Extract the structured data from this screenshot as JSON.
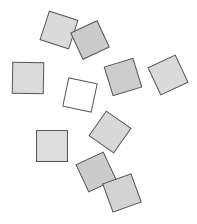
{
  "diagram": {
    "background": "#ffffff",
    "stroke": "#555555",
    "shapes": [
      {
        "id": "square-1",
        "cx": 59,
        "cy": 30,
        "size": 30,
        "rotation": 18,
        "fill": "#dadada"
      },
      {
        "id": "square-2",
        "cx": 90,
        "cy": 40,
        "size": 29,
        "rotation": -25,
        "fill": "#cbcbcb"
      },
      {
        "id": "square-3",
        "cx": 28,
        "cy": 78,
        "size": 31,
        "rotation": 1,
        "fill": "#dbdbdb"
      },
      {
        "id": "square-4",
        "cx": 80,
        "cy": 95,
        "size": 29,
        "rotation": 12,
        "fill": "#ffffff"
      },
      {
        "id": "square-5",
        "cx": 123,
        "cy": 77,
        "size": 30,
        "rotation": -17,
        "fill": "#cdcdcd"
      },
      {
        "id": "square-6",
        "cx": 168,
        "cy": 75,
        "size": 30,
        "rotation": -25,
        "fill": "#dadada"
      },
      {
        "id": "square-7",
        "cx": 52,
        "cy": 146,
        "size": 31,
        "rotation": 0,
        "fill": "#dcdcdc"
      },
      {
        "id": "square-8",
        "cx": 110,
        "cy": 132,
        "size": 30,
        "rotation": 35,
        "fill": "#d8d8d8"
      },
      {
        "id": "square-9",
        "cx": 96,
        "cy": 172,
        "size": 30,
        "rotation": -25,
        "fill": "#cbcbcb"
      },
      {
        "id": "square-10",
        "cx": 122,
        "cy": 193,
        "size": 30,
        "rotation": -20,
        "fill": "#d3d3d3"
      }
    ]
  }
}
